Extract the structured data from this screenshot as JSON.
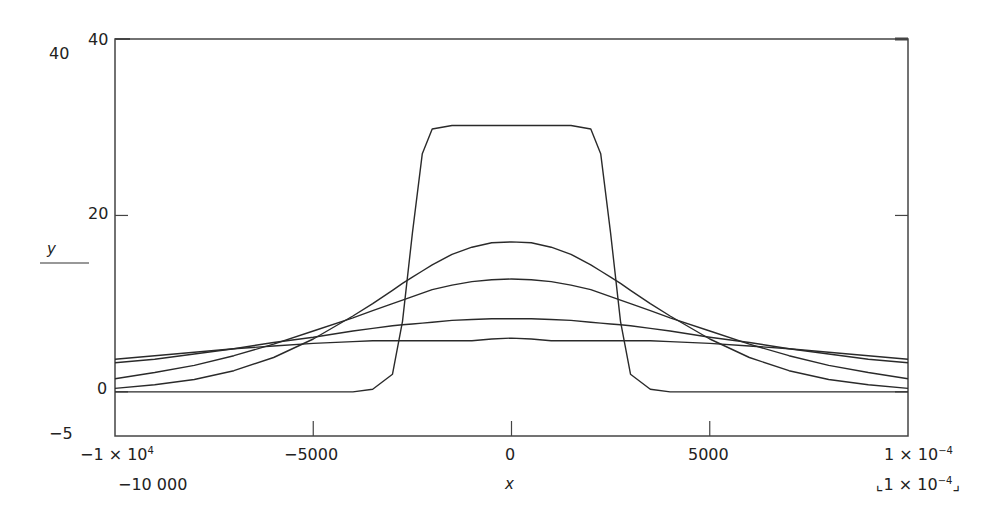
{
  "chart_data": {
    "type": "line",
    "title": "",
    "xlabel": "x",
    "ylabel": "y",
    "xlim": [
      -10000,
      10000
    ],
    "ylim": [
      -5,
      40
    ],
    "grid": false,
    "legend": "none",
    "y_ticks": [
      {
        "value": 40,
        "label": "40"
      },
      {
        "value": 20,
        "label": "20"
      },
      {
        "value": 0,
        "label": "0"
      },
      {
        "value": -5,
        "label": "-5"
      }
    ],
    "x_ticks": [
      {
        "value": -10000,
        "label": "-1 × 10^4"
      },
      {
        "value": -5000,
        "label": "-5000"
      },
      {
        "value": 0,
        "label": "0"
      },
      {
        "value": 5000,
        "label": "5000"
      },
      {
        "value": 10000,
        "label": "1 × 10^-4"
      }
    ],
    "x": [
      -10000,
      -9000,
      -8000,
      -7000,
      -6000,
      -5000,
      -4000,
      -3500,
      -3000,
      -2750,
      -2500,
      -2250,
      -2000,
      -1500,
      -1000,
      -500,
      0,
      500,
      1000,
      1500,
      2000,
      2250,
      2500,
      2750,
      3000,
      3500,
      4000,
      5000,
      6000,
      7000,
      8000,
      9000,
      10000
    ],
    "series": [
      {
        "name": "curve-1-pulse",
        "values": [
          0,
          0,
          0,
          0,
          0,
          0,
          0,
          0.3,
          2,
          8,
          18,
          27,
          29.8,
          30.2,
          30.2,
          30.2,
          30.2,
          30.2,
          30.2,
          30.2,
          29.8,
          27,
          18,
          8,
          2,
          0.3,
          0,
          0,
          0,
          0,
          0,
          0,
          0
        ]
      },
      {
        "name": "curve-2",
        "values": [
          0.4,
          0.8,
          1.4,
          2.4,
          3.9,
          6.0,
          8.6,
          10.0,
          11.5,
          12.3,
          13.0,
          13.7,
          14.4,
          15.6,
          16.4,
          16.9,
          17.0,
          16.9,
          16.4,
          15.6,
          14.4,
          13.7,
          13.0,
          12.3,
          11.5,
          10.0,
          8.6,
          6.0,
          3.9,
          2.4,
          1.4,
          0.8,
          0.4
        ]
      },
      {
        "name": "curve-3",
        "values": [
          1.5,
          2.2,
          3.0,
          4.1,
          5.4,
          6.9,
          8.4,
          9.2,
          10.0,
          10.4,
          10.8,
          11.2,
          11.6,
          12.1,
          12.5,
          12.7,
          12.8,
          12.7,
          12.5,
          12.1,
          11.6,
          11.2,
          10.8,
          10.4,
          10.0,
          9.2,
          8.4,
          6.9,
          5.4,
          4.1,
          3.0,
          2.2,
          1.5
        ]
      },
      {
        "name": "curve-4",
        "values": [
          3.3,
          3.7,
          4.3,
          4.9,
          5.6,
          6.2,
          6.9,
          7.2,
          7.5,
          7.6,
          7.7,
          7.8,
          7.9,
          8.1,
          8.2,
          8.3,
          8.3,
          8.3,
          8.2,
          8.1,
          7.9,
          7.8,
          7.7,
          7.6,
          7.5,
          7.2,
          6.9,
          6.2,
          5.6,
          4.9,
          4.3,
          3.7,
          3.3
        ]
      },
      {
        "name": "curve-5",
        "values": [
          3.7,
          4.1,
          4.5,
          4.9,
          5.2,
          5.5,
          5.7,
          5.8,
          5.8,
          5.8,
          5.8,
          5.8,
          5.8,
          5.8,
          5.8,
          6.0,
          6.1,
          6.0,
          5.8,
          5.8,
          5.8,
          5.8,
          5.8,
          5.8,
          5.8,
          5.8,
          5.7,
          5.5,
          5.2,
          4.9,
          4.5,
          4.1,
          3.7
        ]
      }
    ]
  },
  "labels": {
    "y_top_outer": "40",
    "y_top_inner": "40",
    "y_20": "20",
    "y_0": "0",
    "y_min": "−5",
    "y_axis_title": "y",
    "x_min_sci": "−1 × 10",
    "x_min_sci_exp": "4",
    "x_min_plain": "−10 000",
    "x_m5000": "−5000",
    "x_0": "0",
    "x_5000": "5000",
    "x_max_sci": "1 × 10",
    "x_max_sci_exp": "−4",
    "x_max_plain": "⌞1 × 10",
    "x_max_plain_exp": "−4",
    "x_max_plain_end": "⌟",
    "x_axis_title": "x"
  },
  "style": {
    "line_color": "#2a2a2a",
    "axis_color": "#444444",
    "background": "#ffffff"
  }
}
